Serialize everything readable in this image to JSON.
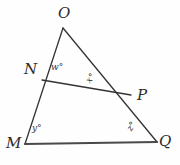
{
  "figure": {
    "kind": "geometry-diagram",
    "background_color": "#fefefe",
    "stroke_color": "#333333",
    "base_stroke_color": "#4a4a4a"
  },
  "points": {
    "O": {
      "label": "O",
      "x": 63,
      "y": 28
    },
    "N": {
      "label": "N",
      "x": 42,
      "y": 80
    },
    "P": {
      "label": "P",
      "x": 131,
      "y": 95
    },
    "M": {
      "label": "M",
      "x": 25,
      "y": 144
    },
    "Q": {
      "label": "Q",
      "x": 157,
      "y": 142
    }
  },
  "segments": [
    {
      "name": "OM",
      "from": "O",
      "to": "M",
      "width": 1.3
    },
    {
      "name": "OQ",
      "from": "O",
      "to": "Q",
      "width": 1.3
    },
    {
      "name": "MQ",
      "from": "M",
      "to": "Q",
      "width": 2.2
    },
    {
      "name": "NP",
      "from": "N",
      "to": "P",
      "width": 1.3
    }
  ],
  "angles": {
    "w": {
      "label": "w°",
      "at_vertex": "N",
      "note": "angle O N P, interior above segment NP"
    },
    "x": {
      "label": "x°",
      "at_vertex": "P",
      "note": "angle N P O, interior above segment NP",
      "rotation_deg": -52
    },
    "y": {
      "label": "y°",
      "at_vertex": "M",
      "note": "angle O M Q, interior of triangle"
    },
    "z": {
      "label": "z°",
      "at_vertex": "Q",
      "note": "angle P Q M, interior of triangle",
      "rotation_deg": -58
    }
  }
}
